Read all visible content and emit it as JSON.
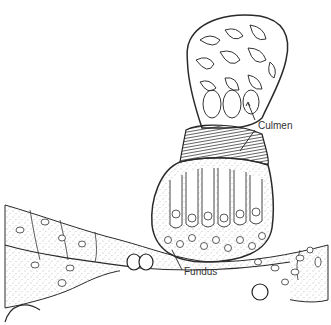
{
  "figure": {
    "type": "biological-line-drawing",
    "labels": [
      {
        "id": "culmen",
        "text": "Culmen",
        "x": 258,
        "y": 126
      },
      {
        "id": "fundus",
        "text": "Fundus",
        "x": 184,
        "y": 272
      }
    ],
    "colors": {
      "ink": "#2a2a2a",
      "stipple": "#555555",
      "background": "#ffffff"
    }
  }
}
